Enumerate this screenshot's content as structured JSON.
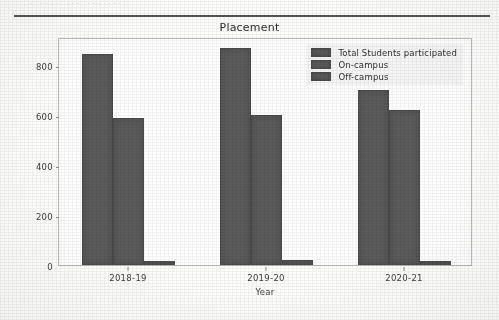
{
  "scan": {
    "top_cut_text": "· ···· ··· ··· ···"
  },
  "chart_data": {
    "type": "bar",
    "title": "Placement",
    "xlabel": "Year",
    "ylabel": "",
    "categories": [
      "2018-19",
      "2019-20",
      "2020-21"
    ],
    "series": [
      {
        "name": "Total Students participated",
        "values": [
          845,
          870,
          700
        ],
        "color": "#5b5b5b"
      },
      {
        "name": "On-campus",
        "values": [
          590,
          600,
          620
        ],
        "color": "#5b5b5b"
      },
      {
        "name": "Off-campus",
        "values": [
          18,
          22,
          18
        ],
        "color": "#5b5b5b"
      }
    ],
    "ylim": [
      0,
      912
    ],
    "yticks": [
      0,
      200,
      400,
      600,
      800
    ],
    "ytick_labels": [
      "0",
      "200",
      "400",
      "600",
      "800"
    ],
    "grid": false,
    "legend_position": "upper right",
    "bar_style": "grouped-adjacent"
  }
}
